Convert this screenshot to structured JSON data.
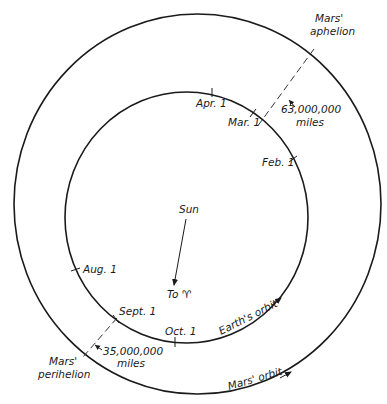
{
  "diagram": {
    "center_label": "Sun",
    "direction_label": "To ♈",
    "orbits": {
      "earth": {
        "label": "Earth's orbit"
      },
      "mars": {
        "label": "Mars' orbit"
      }
    },
    "months": [
      {
        "label": "Apr. 1"
      },
      {
        "label": "Mar. 1"
      },
      {
        "label": "Feb. 1"
      },
      {
        "label": "Aug. 1"
      },
      {
        "label": "Sept. 1"
      },
      {
        "label": "Oct. 1"
      }
    ],
    "aphelion": {
      "label_line1": "Mars'",
      "label_line2": "aphelion",
      "distance": "63,000,000",
      "unit": "miles"
    },
    "perihelion": {
      "label_line1": "Mars'",
      "label_line2": "perihelion",
      "distance": "35,000,000",
      "unit": "miles"
    }
  }
}
